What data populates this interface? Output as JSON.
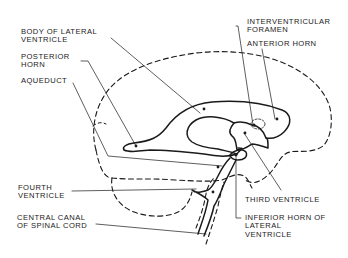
{
  "diagram": {
    "colors": {
      "line": "#1a1a1a",
      "background": "#ffffff"
    },
    "labels": {
      "body_of_lateral_ventricle": {
        "line1": "BODY OF LATERAL",
        "line2": "VENTRICLE"
      },
      "posterior_horn": {
        "line1": "POSTERIOR",
        "line2": "HORN"
      },
      "aqueduct": {
        "line1": "AQUEDUCT"
      },
      "interventricular_foramen": {
        "line1": "INTERVENTRICULAR",
        "line2": "FORAMEN"
      },
      "anterior_horn": {
        "line1": "ANTERIOR HORN"
      },
      "third_ventricle": {
        "line1": "THIRD VENTRICLE"
      },
      "fourth_ventricle": {
        "line1": "FOURTH",
        "line2": "VENTRICLE"
      },
      "central_canal": {
        "line1": "CENTRAL CANAL",
        "line2": "OF SPINAL CORD"
      },
      "inferior_horn": {
        "line1": "INFERIOR HORN OF",
        "line2": "LATERAL",
        "line3": "VENTRICLE"
      }
    }
  }
}
